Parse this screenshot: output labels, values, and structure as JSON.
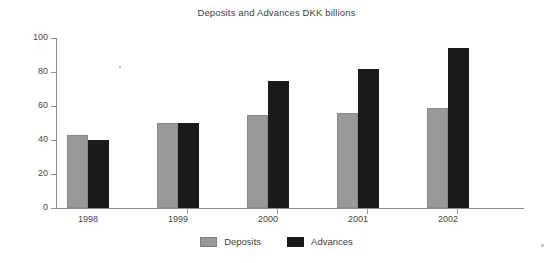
{
  "chart_data": {
    "type": "bar",
    "title": "Deposits and Advances DKK billions",
    "xlabel": "",
    "ylabel": "",
    "categories": [
      "1998",
      "1999",
      "2000",
      "2001",
      "2002"
    ],
    "series": [
      {
        "name": "Deposits",
        "color": "#999999",
        "values": [
          43,
          50,
          55,
          56,
          59
        ]
      },
      {
        "name": "Advances",
        "color": "#1a1a1a",
        "values": [
          40,
          50,
          75,
          82,
          94
        ]
      }
    ],
    "ylim": [
      0,
      100
    ],
    "yticks": [
      0,
      20,
      40,
      60,
      80,
      100
    ],
    "ytick_labels": [
      "0",
      "20",
      "40",
      "60",
      "80",
      "100"
    ],
    "grid": false,
    "legend_position": "bottom"
  },
  "legend": {
    "items": [
      {
        "label": "Deposits",
        "color": "#999999"
      },
      {
        "label": "Advances",
        "color": "#1a1a1a"
      }
    ]
  }
}
